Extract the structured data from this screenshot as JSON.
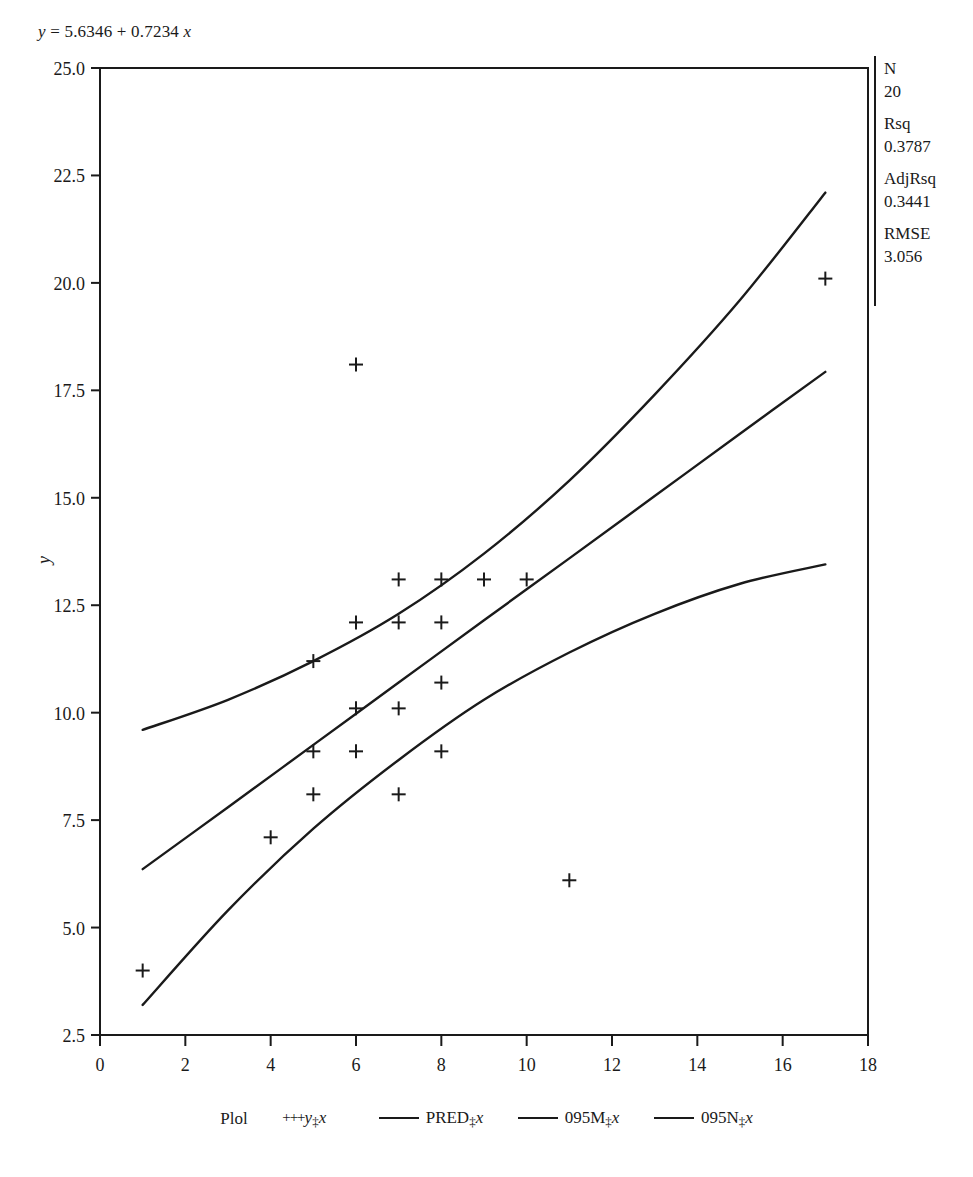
{
  "equation": {
    "lhs": "y",
    "eq": "=",
    "intercept": "5.6346",
    "plus": "+",
    "slope": "0.7234",
    "xvar": "x",
    "full": "y = 5.6346 + 0.7234 x"
  },
  "stats": [
    {
      "key": "N",
      "value": "20"
    },
    {
      "key": "Rsq",
      "value": "0.3787"
    },
    {
      "key": "AdjRsq",
      "value": "0.3441"
    },
    {
      "key": "RMSE",
      "value": "3.056"
    }
  ],
  "legend": {
    "title": "Plol",
    "items": [
      {
        "marker": "+++",
        "label": "y",
        "sep": "‡",
        "x": "x"
      },
      {
        "marker": "line",
        "label": "PRED",
        "sep": "‡",
        "x": "x"
      },
      {
        "marker": "line",
        "label": "095M",
        "sep": "‡",
        "x": "x"
      },
      {
        "marker": "line",
        "label": "095N",
        "sep": "‡",
        "x": "x"
      }
    ]
  },
  "chart_data": {
    "type": "scatter",
    "title": "y = 5.6346 + 0.7234 x",
    "xlabel": "",
    "ylabel": "y",
    "xlim": [
      0,
      18
    ],
    "ylim": [
      2.5,
      25.0
    ],
    "xticks": [
      0,
      2,
      4,
      6,
      8,
      10,
      12,
      14,
      16,
      18
    ],
    "yticks": [
      2.5,
      5.0,
      7.5,
      10.0,
      12.5,
      15.0,
      17.5,
      20.0,
      22.5,
      25.0
    ],
    "grid": false,
    "legend_position": "bottom",
    "marker": "+",
    "series": [
      {
        "name": "y*x",
        "type": "scatter",
        "points": [
          [
            1,
            4.0
          ],
          [
            4,
            7.1
          ],
          [
            5,
            11.2
          ],
          [
            5,
            9.1
          ],
          [
            5,
            8.1
          ],
          [
            6,
            18.1
          ],
          [
            6,
            12.1
          ],
          [
            6,
            10.1
          ],
          [
            6,
            9.1
          ],
          [
            7,
            13.1
          ],
          [
            7,
            12.1
          ],
          [
            7,
            10.1
          ],
          [
            7,
            8.1
          ],
          [
            8,
            13.1
          ],
          [
            8,
            12.1
          ],
          [
            8,
            10.7
          ],
          [
            8,
            9.1
          ],
          [
            9,
            13.1
          ],
          [
            10,
            13.1
          ],
          [
            11,
            6.1
          ],
          [
            17,
            20.1
          ]
        ]
      },
      {
        "name": "PRED*x",
        "type": "line",
        "comment": "fitted regression line y = 5.6346 + 0.7234 x",
        "x": [
          1,
          3,
          5,
          7,
          9,
          11,
          13,
          15,
          17
        ],
        "y": [
          6.36,
          7.8,
          9.25,
          10.7,
          12.15,
          13.59,
          15.04,
          16.49,
          17.93
        ]
      },
      {
        "name": "095M*x",
        "type": "line",
        "comment": "upper 95% mean confidence limit",
        "x": [
          1,
          3,
          5,
          7,
          9,
          11,
          13,
          15,
          17
        ],
        "y": [
          9.6,
          10.3,
          11.2,
          12.3,
          13.7,
          15.4,
          17.4,
          19.6,
          22.1
        ]
      },
      {
        "name": "095N*x",
        "type": "line",
        "comment": "lower 95% mean confidence limit",
        "x": [
          1,
          3,
          5,
          7,
          9,
          11,
          13,
          15,
          17
        ],
        "y": [
          3.2,
          5.4,
          7.3,
          8.9,
          10.3,
          11.4,
          12.3,
          13.0,
          13.45
        ]
      }
    ]
  }
}
